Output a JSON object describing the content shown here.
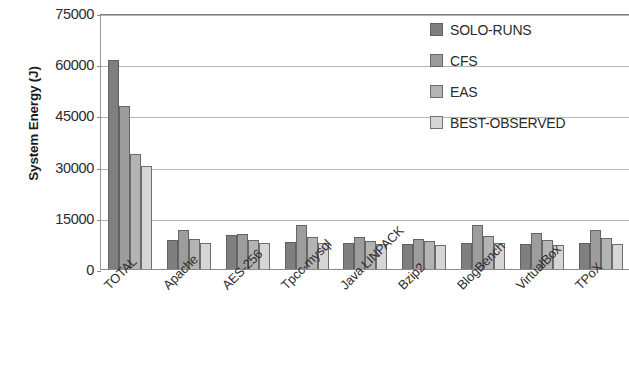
{
  "chart_data": {
    "type": "bar",
    "title": "",
    "xlabel": "",
    "ylabel": "System Energy (J)",
    "ylim": [
      0,
      75000
    ],
    "yticks": [
      0,
      15000,
      30000,
      45000,
      60000,
      75000
    ],
    "ytick_labels": [
      "0",
      "15000",
      "30000",
      "45000",
      "60000",
      "75000"
    ],
    "grid": true,
    "legend_position": "top-right",
    "categories": [
      "TOTAL",
      "Apache",
      "AES-256",
      "Tpcc-mysql",
      "Java LINPACK",
      "Bzip2",
      "BlogBench",
      "VirtualBox",
      "TPoX"
    ],
    "series": [
      {
        "name": "SOLO-RUNS",
        "color": "#7f7f7f",
        "values": [
          61500,
          8700,
          10300,
          8100,
          8000,
          7600,
          8000,
          7700,
          7800
        ]
      },
      {
        "name": "CFS",
        "color": "#9d9d9d",
        "values": [
          48000,
          11600,
          10600,
          13100,
          9700,
          9200,
          13300,
          10700,
          11600
        ]
      },
      {
        "name": "EAS",
        "color": "#b4b4b4",
        "values": [
          34000,
          9200,
          8900,
          9800,
          8600,
          8400,
          10000,
          8900,
          9500
        ]
      },
      {
        "name": "BEST-OBSERVED",
        "color": "#d6d6d6",
        "values": [
          30500,
          7900,
          7800,
          8000,
          7500,
          7300,
          7900,
          7400,
          7700
        ]
      }
    ]
  },
  "legend": {
    "items": [
      {
        "label": "SOLO-RUNS"
      },
      {
        "label": "CFS"
      },
      {
        "label": "EAS"
      },
      {
        "label": "BEST-OBSERVED"
      }
    ]
  }
}
